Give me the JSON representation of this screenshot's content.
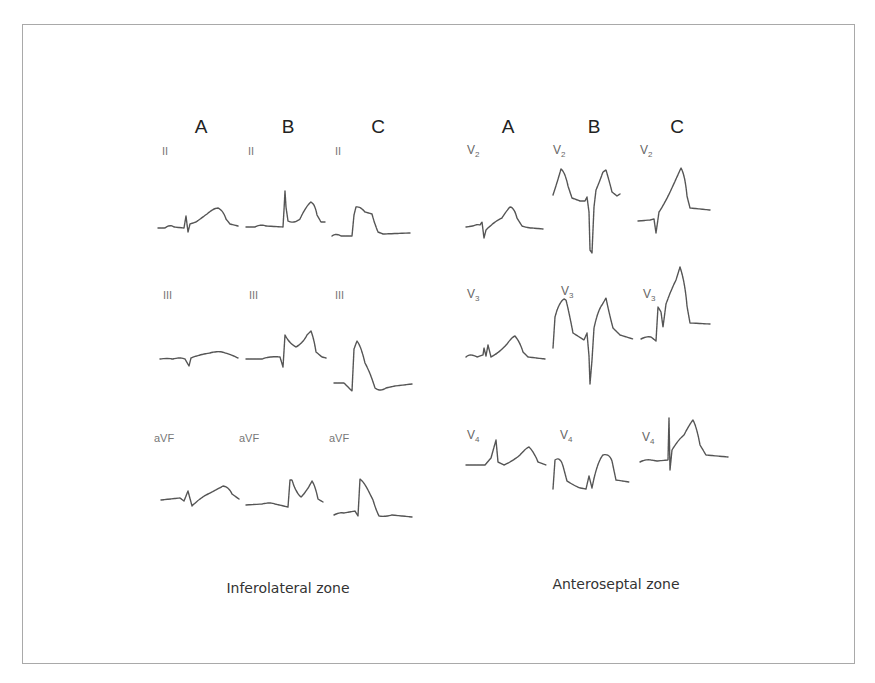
{
  "figure": {
    "panels": [
      {
        "id": "inferolateral",
        "zone_label": "Inferolateral zone",
        "columns": [
          "A",
          "B",
          "C"
        ],
        "rows": [
          {
            "leads": [
              "II",
              "II",
              "II"
            ]
          },
          {
            "leads": [
              "III",
              "III",
              "III"
            ]
          },
          {
            "leads": [
              "aVF",
              "aVF",
              "aVF"
            ]
          }
        ]
      },
      {
        "id": "anteroseptal",
        "zone_label": "Anteroseptal zone",
        "columns": [
          "A",
          "B",
          "C"
        ],
        "rows": [
          {
            "leads": [
              {
                "base": "V",
                "sub": "2"
              },
              {
                "base": "V",
                "sub": "2"
              },
              {
                "base": "V",
                "sub": "2"
              }
            ]
          },
          {
            "leads": [
              {
                "base": "V",
                "sub": "3"
              },
              {
                "base": "V",
                "sub": "3"
              },
              {
                "base": "V",
                "sub": "3"
              }
            ]
          },
          {
            "leads": [
              {
                "base": "V",
                "sub": "4"
              },
              {
                "base": "V",
                "sub": "4"
              },
              {
                "base": "V",
                "sub": "4"
              }
            ]
          }
        ]
      }
    ],
    "colors": {
      "frame": "#a9a9a9",
      "trace": "#555555",
      "text": "#222222",
      "lead_label": "#777777"
    }
  }
}
